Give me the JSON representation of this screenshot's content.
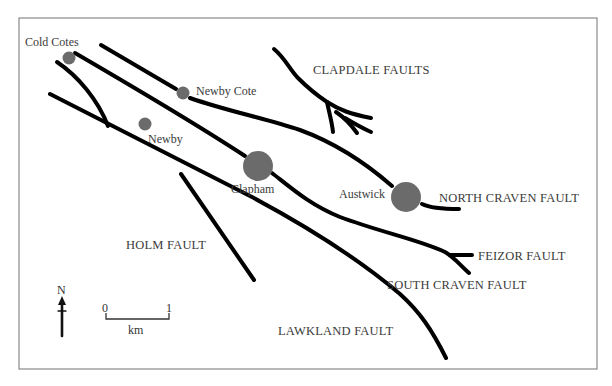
{
  "map": {
    "frame": {
      "x": 19,
      "y": 18,
      "width": 578,
      "height": 351,
      "border_color": "#8a8a8a"
    },
    "fault_color": "#000000",
    "town_color": "#6b6b6b",
    "towns": [
      {
        "name": "Cold Cotes",
        "cx": 69,
        "cy": 58,
        "r": 6.5,
        "label_x": 25,
        "label_y": 46
      },
      {
        "name": "Newby Cote",
        "cx": 183,
        "cy": 93,
        "r": 6.5,
        "label_x": 196,
        "label_y": 95
      },
      {
        "name": "Newby",
        "cx": 145,
        "cy": 124,
        "r": 6.5,
        "label_x": 148,
        "label_y": 143
      },
      {
        "name": "Clapham",
        "cx": 258,
        "cy": 166,
        "r": 15,
        "label_x": 231,
        "label_y": 193
      },
      {
        "name": "Austwick",
        "cx": 406,
        "cy": 197,
        "r": 15,
        "label_x": 339,
        "label_y": 194
      }
    ],
    "faults": [
      {
        "name": "North Craven Fault",
        "label": "NORTH CRAVEN FAULT",
        "label_x": 438,
        "label_y": 201
      },
      {
        "name": "South Craven Fault",
        "label": "SOUTH CRAVEN FAULT",
        "label_x": 387,
        "label_y": 288
      },
      {
        "name": "Feizor Fault",
        "label": "FEIZOR FAULT",
        "label_x": 478,
        "label_y": 259
      },
      {
        "name": "Clapdale Faults",
        "label": "CLAPDALE FAULTS",
        "label_x": 312,
        "label_y": 74
      },
      {
        "name": "Holm Fault",
        "label": "HOLM FAULT",
        "label_x": 126,
        "label_y": 249
      },
      {
        "name": "Lawkland Fault",
        "label": "LAWKLAND FAULT",
        "label_x": 278,
        "label_y": 334
      }
    ],
    "north_arrow": {
      "label": "N",
      "x": 62,
      "y_top": 297,
      "y_bottom": 336
    },
    "scale_bar": {
      "start_label": "0",
      "end_label": "1",
      "unit": "km",
      "x_start": 106,
      "x_end": 169,
      "y": 318
    }
  }
}
